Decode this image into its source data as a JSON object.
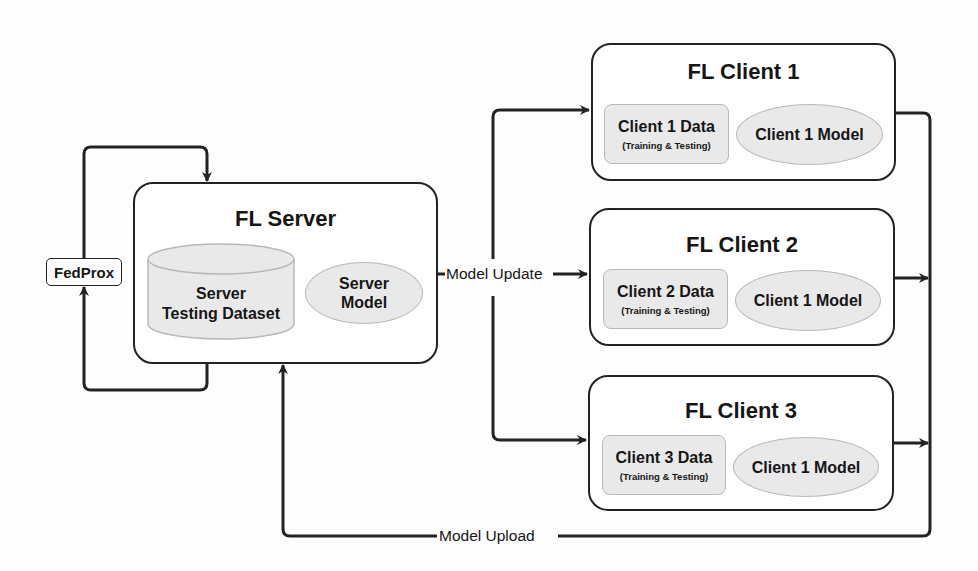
{
  "diagram": {
    "type": "federated-learning-architecture",
    "server": {
      "title": "FL Server",
      "dataset": {
        "line1": "Server",
        "line2": "Testing Dataset"
      },
      "model": {
        "line1": "Server",
        "line2": "Model"
      }
    },
    "aggregator": {
      "label": "FedProx"
    },
    "clients": [
      {
        "title": "FL Client 1",
        "data_label": "Client 1 Data",
        "data_sub": "(Training & Testing)",
        "model_label": "Client 1 Model"
      },
      {
        "title": "FL Client 2",
        "data_label": "Client 2 Data",
        "data_sub": "(Training & Testing)",
        "model_label": "Client 1 Model"
      },
      {
        "title": "FL Client 3",
        "data_label": "Client 3 Data",
        "data_sub": "(Training & Testing)",
        "model_label": "Client 1 Model"
      }
    ],
    "edges": {
      "update_label": "Model Update",
      "upload_label": "Model Upload"
    },
    "colors": {
      "line": "#222222",
      "node_fill": "#e9e9e9",
      "node_border": "#b8b8b8",
      "box_fill": "#ffffff"
    }
  }
}
